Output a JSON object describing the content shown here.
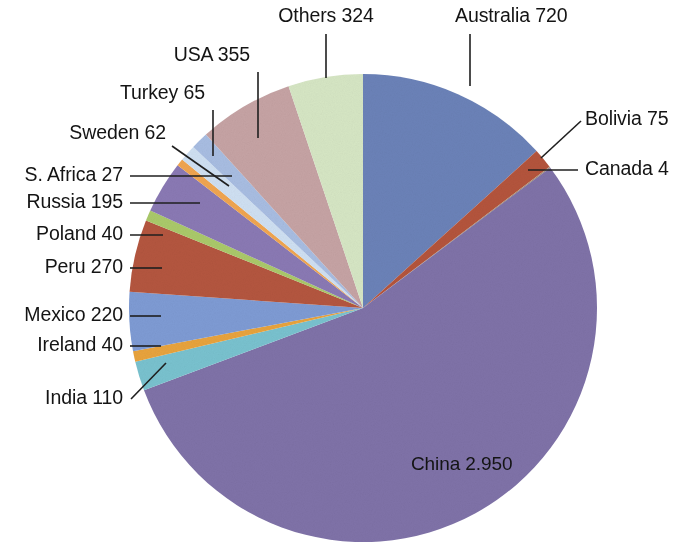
{
  "chart_data": {
    "type": "pie",
    "title": "",
    "subtitle": "",
    "units": "",
    "total": 5412,
    "legend_position": "none",
    "labels_style": "callout-leader-lines",
    "decimal_separator": ".",
    "categories": [
      "Australia",
      "Bolivia",
      "Canada",
      "China",
      "India",
      "Ireland",
      "Mexico",
      "Peru",
      "Poland",
      "Russia",
      "S. Africa",
      "Sweden",
      "Turkey",
      "USA",
      "Others"
    ],
    "values": [
      720,
      75,
      4,
      2950,
      110,
      40,
      220,
      270,
      40,
      195,
      27,
      62,
      65,
      355,
      324
    ],
    "value_labels": [
      "720",
      "75",
      "4",
      "2.950",
      "110",
      "40",
      "220",
      "270",
      "40",
      "195",
      "27",
      "62",
      "65",
      "355",
      "324"
    ],
    "colors": [
      "#6b82b8",
      "#b4543c",
      "#a88f74",
      "#7f72a8",
      "#79c2cf",
      "#e8a33d",
      "#7e9bd4",
      "#b4563f",
      "#aac96a",
      "#8a79b4",
      "#f0a550",
      "#cfe0f2",
      "#a8bde2",
      "#c6a3a4",
      "#d6e6c4"
    ],
    "slices": [
      {
        "name": "Australia",
        "label": "Australia 720",
        "value": 720,
        "value_label": "720",
        "color": "#6b82b8",
        "start_angle": 0.0,
        "end_angle": 47.893
      },
      {
        "name": "Bolivia",
        "label": "Bolivia 75",
        "value": 75,
        "value_label": "75",
        "color": "#b4543c",
        "start_angle": 47.893,
        "end_angle": 52.882
      },
      {
        "name": "Canada",
        "label": "Canada 4",
        "value": 4,
        "value_label": "4",
        "color": "#a88f74",
        "start_angle": 52.882,
        "end_angle": 53.148
      },
      {
        "name": "China",
        "label": "China 2.950",
        "value": 2950,
        "value_label": "2.950",
        "color": "#7f72a8",
        "start_angle": 53.148,
        "end_angle": 249.39
      },
      {
        "name": "India",
        "label": "India 110",
        "value": 110,
        "value_label": "110",
        "color": "#79c2cf",
        "start_angle": 249.39,
        "end_angle": 256.707
      },
      {
        "name": "Ireland",
        "label": "Ireland 40",
        "value": 40,
        "value_label": "40",
        "color": "#e8a33d",
        "start_angle": 256.707,
        "end_angle": 259.368
      },
      {
        "name": "Mexico",
        "label": "Mexico 220",
        "value": 220,
        "value_label": "220",
        "color": "#7e9bd4",
        "start_angle": 259.368,
        "end_angle": 273.999
      },
      {
        "name": "Peru",
        "label": "Peru 270",
        "value": 270,
        "value_label": "270",
        "color": "#b4563f",
        "start_angle": 273.999,
        "end_angle": 291.954
      },
      {
        "name": "Poland",
        "label": "Poland 40",
        "value": 40,
        "value_label": "40",
        "color": "#aac96a",
        "start_angle": 291.954,
        "end_angle": 294.615
      },
      {
        "name": "Russia",
        "label": "Russia 195",
        "value": 195,
        "value_label": "195",
        "color": "#8a79b4",
        "start_angle": 294.615,
        "end_angle": 307.588
      },
      {
        "name": "S. Africa",
        "label": "S. Africa 27",
        "value": 27,
        "value_label": "27",
        "color": "#f0a550",
        "start_angle": 307.588,
        "end_angle": 309.384
      },
      {
        "name": "Sweden",
        "label": "Sweden 62",
        "value": 62,
        "value_label": "62",
        "color": "#cfe0f2",
        "start_angle": 309.384,
        "end_angle": 313.508
      },
      {
        "name": "Turkey",
        "label": "Turkey 65",
        "value": 65,
        "value_label": "65",
        "color": "#a8bde2",
        "start_angle": 313.508,
        "end_angle": 317.832
      },
      {
        "name": "USA",
        "label": "USA 355",
        "value": 355,
        "value_label": "355",
        "color": "#c6a3a4",
        "start_angle": 317.832,
        "end_angle": 341.448
      },
      {
        "name": "Others",
        "label": "Others 324",
        "value": 324,
        "value_label": "324",
        "color": "#d6e6c4",
        "start_angle": 341.448,
        "end_angle": 360.0
      }
    ]
  },
  "labels": {
    "others": {
      "text": "Others 324",
      "x": 326,
      "y": 22,
      "anchor": "mid"
    },
    "australia": {
      "text": "Australia 720",
      "x": 455,
      "y": 22,
      "anchor": "start"
    },
    "usa": {
      "text": "USA 355",
      "x": 250,
      "y": 61,
      "anchor": "end"
    },
    "bolivia": {
      "text": "Bolivia 75",
      "x": 585,
      "y": 125,
      "anchor": "start"
    },
    "turkey": {
      "text": "Turkey 65",
      "x": 205,
      "y": 99,
      "anchor": "end"
    },
    "canada": {
      "text": "Canada 4",
      "x": 585,
      "y": 175,
      "anchor": "start"
    },
    "sweden": {
      "text": "Sweden 62",
      "x": 166,
      "y": 139,
      "anchor": "end"
    },
    "safrica": {
      "text": "S. Africa 27",
      "x": 123,
      "y": 181,
      "anchor": "end"
    },
    "russia": {
      "text": "Russia 195",
      "x": 123,
      "y": 208,
      "anchor": "end"
    },
    "poland": {
      "text": "Poland 40",
      "x": 123,
      "y": 240,
      "anchor": "end"
    },
    "peru": {
      "text": "Peru 270",
      "x": 123,
      "y": 273,
      "anchor": "end"
    },
    "mexico": {
      "text": "Mexico 220",
      "x": 123,
      "y": 321,
      "anchor": "end"
    },
    "ireland": {
      "text": "Ireland 40",
      "x": 123,
      "y": 351,
      "anchor": "end"
    },
    "india": {
      "text": "India 110",
      "x": 123,
      "y": 404,
      "anchor": "end"
    },
    "china": {
      "text": "China 2.950",
      "x": 411,
      "y": 470,
      "anchor": "start"
    }
  }
}
